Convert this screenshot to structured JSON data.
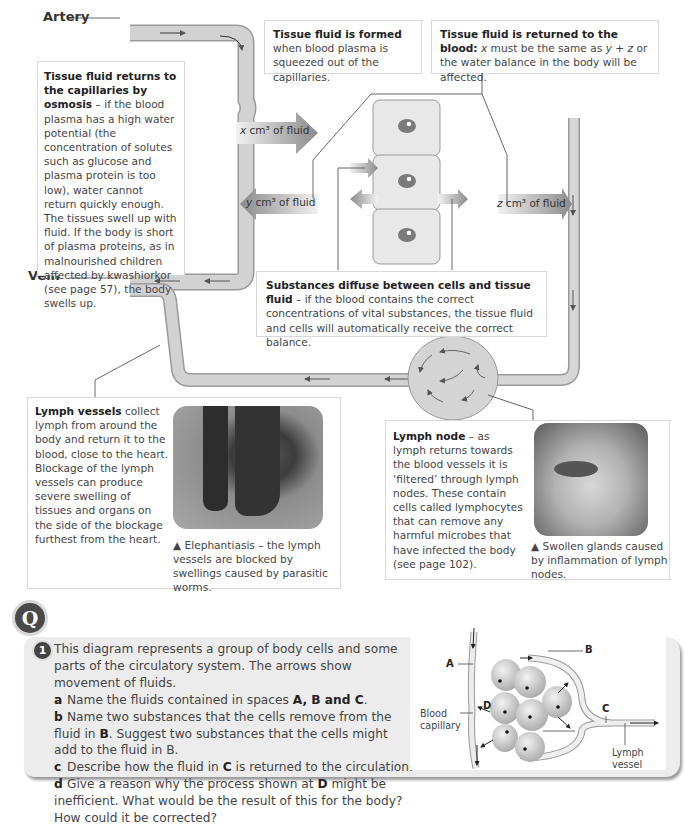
{
  "diagram": {
    "labels": {
      "artery": "Artery",
      "vein": "Vein"
    },
    "fluid_arrows": {
      "x": {
        "var": "x",
        "text": " cm³ of fluid"
      },
      "y": {
        "var": "y",
        "text": " cm³ of fluid"
      },
      "z": {
        "var": "z",
        "text": " cm³ of fluid"
      }
    },
    "colors": {
      "vessel_fill": "#cfcfcf",
      "vessel_stroke": "#9a9a9a",
      "cell_fill": "#e6e6e6",
      "nucleus": "#7a7a7a",
      "arrow_dark": "#8a8a8a"
    }
  },
  "callouts": {
    "osmosis": {
      "title": "Tissue fluid returns to the capillaries by osmosis",
      "body": " – if the blood plasma has a high water potential (the concentration of solutes such as glucose and plasma protein is too low), water cannot return quickly enough. The tissues swell up with fluid. If the body is short of plasma proteins, as in malnourished children affected by kwashiorkor (see page 57), the body swells up."
    },
    "formed": {
      "title": "Tissue fluid is formed",
      "body": " when blood plasma is squeezed out of the capillaries."
    },
    "returned": {
      "title": "Tissue fluid is returned to the blood:",
      "body_1": " x",
      "body_2": " must be the same as ",
      "body_3": "y + z",
      "body_4": " or the water balance in the body will be affected."
    },
    "diffuse": {
      "title": "Substances diffuse between cells and tissue fluid",
      "body": " – if the blood contains the correct concentrations of vital substances, the tissue fluid and cells will automatically receive the correct balance."
    },
    "lymph_vessels": {
      "title": "Lymph vessels",
      "body": " collect lymph from around the body and return it to the blood, close to the heart. Blockage of the lymph vessels can produce severe swelling of tissues and organs on the side of the blockage furthest from the heart.",
      "photo_caption": "▲ Elephantiasis – the lymph vessels are blocked by swellings caused by parasitic worms."
    },
    "lymph_node": {
      "title": "Lymph node",
      "body": " – as lymph returns towards the blood vessels it is ‘filtered’ through lymph nodes. These contain cells called lymphocytes that can remove any harmful microbes that have infected the body (see page 102).",
      "photo_caption": "▲ Swollen glands caused by inflammation of lymph nodes."
    }
  },
  "question": {
    "badge": "Q",
    "number": "1",
    "intro": "This diagram represents a group of body cells and some parts of the circulatory system. The arrows show movement of fluids.",
    "parts": [
      {
        "letter": "a",
        "text": "Name the fluids contained in spaces ",
        "bold_tail": "A, B and C",
        "after": "."
      },
      {
        "letter": "b",
        "text": "Name two substances that the cells remove from the fluid in ",
        "bold_tail": "B",
        "after": ". Suggest two substances that the cells might add to the fluid in B."
      },
      {
        "letter": "c",
        "text": "Describe how the fluid in ",
        "bold_tail": "C",
        "after": " is returned to the circulation."
      },
      {
        "letter": "d",
        "text": "Give a reason why the process shown at ",
        "bold_tail": "D",
        "after": " might be inefficient. What would be the result of this for the body? How could it be corrected?"
      }
    ],
    "figure_labels": {
      "A": "A",
      "B": "B",
      "C": "C",
      "D": "D",
      "blood_capillary": "Blood capillary",
      "lymph_vessel": "Lymph vessel"
    }
  }
}
